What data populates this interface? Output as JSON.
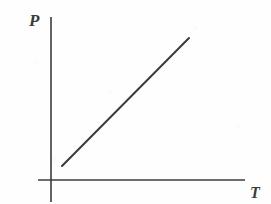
{
  "figure": {
    "background_color": "#fefefe",
    "ink_color": "#3b3b3b",
    "width": 271,
    "height": 204
  },
  "chart_data": {
    "type": "line",
    "title": "",
    "subtitle": "",
    "xlabel": "T",
    "ylabel": "P",
    "xlabel_full": "Temperature",
    "ylabel_full": "Pressure",
    "grid": false,
    "legend": "none",
    "axes": {
      "x_axis": {
        "label": "T",
        "tick_labels": [],
        "ticks": [],
        "arrowhead": false,
        "pixel_y": 180,
        "pixel_x_start": 38,
        "pixel_x_end": 245
      },
      "y_axis": {
        "label": "P",
        "tick_labels": [],
        "ticks": [],
        "arrowhead": false,
        "pixel_x": 51,
        "pixel_y_start": 17,
        "pixel_y_end": 202
      },
      "origin_pixel": {
        "x": 51,
        "y": 180
      }
    },
    "series": [
      {
        "name": "P vs T",
        "style": "solid",
        "color": "#3b3b3b",
        "line_width": 2,
        "relationship": "linear increasing",
        "x": [
          0.11,
          0.76
        ],
        "y": [
          0.08,
          0.79
        ],
        "pixel_points": [
          {
            "x": 62,
            "y": 166
          },
          {
            "x": 189,
            "y": 38
          }
        ]
      }
    ],
    "annotations": [],
    "xlim": [
      0,
      1
    ],
    "ylim": [
      0,
      1
    ]
  },
  "labels": {
    "y_axis_symbol": "P",
    "x_axis_symbol": "T"
  }
}
